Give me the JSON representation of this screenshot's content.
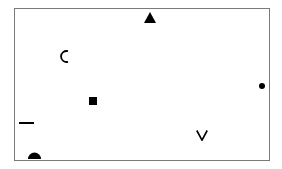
{
  "canvas": {
    "background": "#ffffff",
    "frame_color": "#7a7a7a",
    "shape_color": "#000000"
  },
  "shapes": [
    {
      "kind": "triangle",
      "x": 144,
      "y": 12,
      "w": 12,
      "h": 11
    },
    {
      "kind": "arc-c",
      "x": 60,
      "y": 50,
      "w": 8,
      "h": 13
    },
    {
      "kind": "square",
      "x": 89,
      "y": 97,
      "w": 8,
      "h": 8
    },
    {
      "kind": "dot",
      "x": 259,
      "y": 83,
      "w": 6,
      "h": 6
    },
    {
      "kind": "dash",
      "x": 19,
      "y": 122,
      "w": 15,
      "h": 2
    },
    {
      "kind": "chevron-v",
      "x": 196,
      "y": 130,
      "w": 12,
      "h": 11
    },
    {
      "kind": "semicircle",
      "x": 28,
      "y": 152,
      "w": 13,
      "h": 7
    }
  ]
}
